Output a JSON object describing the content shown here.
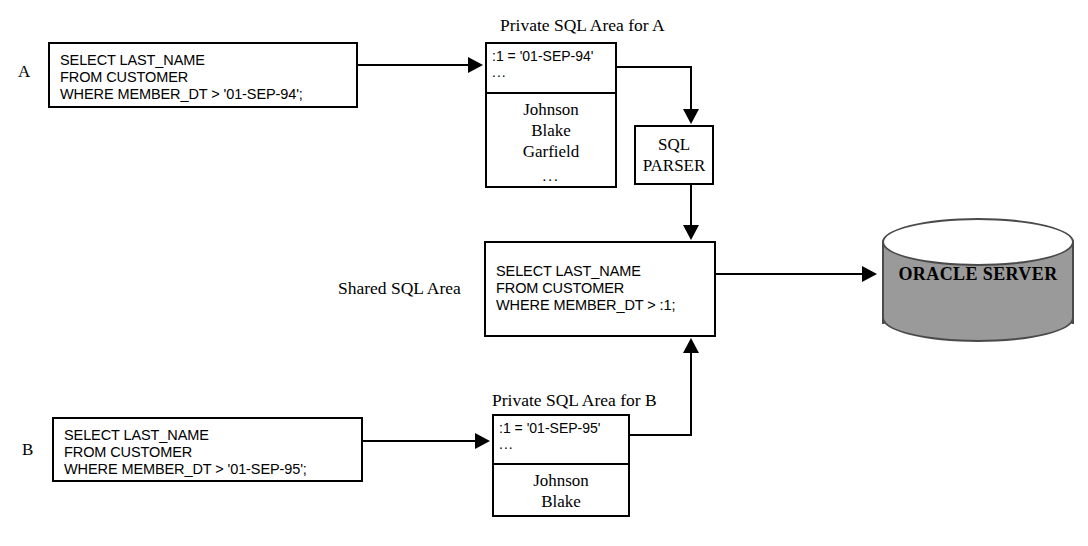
{
  "diagram": {
    "session_a": {
      "label": "A",
      "statement": {
        "line1": "SELECT LAST_NAME",
        "line2": "FROM CUSTOMER",
        "line3": "WHERE MEMBER_DT > '01-SEP-94';"
      },
      "private_area": {
        "caption": "Private SQL Area for A",
        "bind_value": ":1 = '01-SEP-94'",
        "bind_more": "...",
        "rows": [
          "Johnson",
          "Blake",
          "Garfield",
          "..."
        ]
      }
    },
    "session_b": {
      "label": "B",
      "statement": {
        "line1": "SELECT LAST_NAME",
        "line2": "FROM CUSTOMER",
        "line3": "WHERE MEMBER_DT > '01-SEP-95';"
      },
      "private_area": {
        "caption": "Private SQL Area for B",
        "bind_value": ":1 = '01-SEP-95'",
        "bind_more": "...",
        "rows": [
          "Johnson",
          "Blake"
        ]
      }
    },
    "parser": {
      "line1": "SQL",
      "line2": "PARSER"
    },
    "shared_area": {
      "caption": "Shared SQL Area",
      "statement": {
        "line1": "SELECT LAST_NAME",
        "line2": "FROM CUSTOMER",
        "line3": "WHERE MEMBER_DT > :1;"
      }
    },
    "server": {
      "label": "ORACLE SERVER"
    },
    "colors": {
      "stroke": "#000000",
      "background": "#ffffff",
      "cylinder_fill": "#9a9a9a",
      "cylinder_stroke": "#4a4a4a",
      "cylinder_top_fill": "#ffffff"
    }
  }
}
